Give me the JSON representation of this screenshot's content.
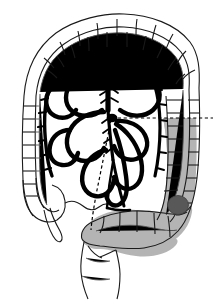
{
  "figure": {
    "title": "Colon with inferior mesenteric arterial supply and sigmoid tumour",
    "caption": "",
    "background_color": "#ffffff",
    "outline_color": "#1a1a1a",
    "vessel_color": "#000000",
    "shaded_segment_color": "#b4b4b4",
    "tumor_color": "#585858",
    "dashed_line_color": "#000000"
  },
  "structures": [
    {
      "id": "transverse-colon",
      "name": "Transverse colon",
      "shaded": false,
      "fill": "#ffffff",
      "haustra": true
    },
    {
      "id": "ascending-colon",
      "name": "Ascending colon",
      "shaded": false,
      "fill": "#ffffff",
      "haustra": true
    },
    {
      "id": "cecum",
      "name": "Cecum",
      "shaded": false,
      "fill": "#ffffff",
      "haustra": true
    },
    {
      "id": "appendix",
      "name": "Vermiform appendix",
      "shaded": false,
      "fill": "#ffffff",
      "haustra": false
    },
    {
      "id": "descending-colon",
      "name": "Descending colon",
      "shaded": true,
      "fill": "#b4b4b4",
      "haustra": true
    },
    {
      "id": "sigmoid-colon",
      "name": "Sigmoid colon",
      "shaded": true,
      "fill": "#b4b4b4",
      "haustra": true
    },
    {
      "id": "rectum",
      "name": "Rectum",
      "shaded": false,
      "fill": "#ffffff",
      "haustra": false
    },
    {
      "id": "mesenteric-artery-trunk",
      "name": "Inferior mesenteric artery trunk",
      "shaded": false,
      "fill": "#000000",
      "haustra": false
    },
    {
      "id": "marginal-artery-arcades",
      "name": "Marginal artery arcades",
      "shaded": false,
      "fill": "#000000",
      "haustra": false
    },
    {
      "id": "tumor-nodule",
      "name": "Tumour nodule",
      "shaded": true,
      "fill": "#585858",
      "haustra": false
    }
  ],
  "markers": [
    {
      "id": "horizontal-resection-line",
      "name": "Horizontal resection margin line",
      "style": "dashed",
      "orientation": "horizontal"
    },
    {
      "id": "diagonal-resection-line",
      "name": "Diagonal resection margin line",
      "style": "dashed",
      "orientation": "diagonal"
    }
  ],
  "labels": {
    "none": ""
  }
}
